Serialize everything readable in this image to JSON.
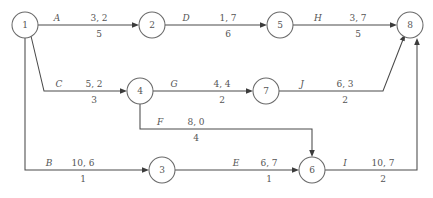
{
  "diagram": {
    "type": "directed-network",
    "node_label_format": "event number",
    "edge_label_format": "activity name, upper pair, lower value",
    "colors": {
      "background": "#ffffff",
      "line": "#4a4a4a",
      "node_stroke": "#6a6a6a",
      "text": "#555555"
    },
    "nodes": [
      {
        "id": "n1",
        "label": "1",
        "x": 25,
        "y": 25,
        "r": 13
      },
      {
        "id": "n2",
        "label": "2",
        "x": 152,
        "y": 25,
        "r": 13
      },
      {
        "id": "n5",
        "label": "5",
        "x": 280,
        "y": 25,
        "r": 13
      },
      {
        "id": "n8",
        "label": "8",
        "x": 410,
        "y": 25,
        "r": 13
      },
      {
        "id": "n4",
        "label": "4",
        "x": 140,
        "y": 91,
        "r": 13
      },
      {
        "id": "n7",
        "label": "7",
        "x": 266,
        "y": 91,
        "r": 13
      },
      {
        "id": "n3",
        "label": "3",
        "x": 162,
        "y": 170,
        "r": 13
      },
      {
        "id": "n6",
        "label": "6",
        "x": 312,
        "y": 170,
        "r": 13
      }
    ],
    "edges": [
      {
        "id": "eA",
        "name": "A",
        "from": "1",
        "to": "2",
        "upper": "3, 2",
        "lower": "5",
        "name_x": 57,
        "name_y": 21,
        "upper_x": 99,
        "upper_y": 21,
        "lower_x": 99,
        "lower_y": 37
      },
      {
        "id": "eD",
        "name": "D",
        "from": "2",
        "to": "5",
        "upper": "1, 7",
        "lower": "6",
        "name_x": 186,
        "name_y": 21,
        "upper_x": 228,
        "upper_y": 21,
        "lower_x": 228,
        "lower_y": 37
      },
      {
        "id": "eH",
        "name": "H",
        "from": "5",
        "to": "8",
        "upper": "3, 7",
        "lower": "5",
        "name_x": 318,
        "name_y": 21,
        "upper_x": 358,
        "upper_y": 21,
        "lower_x": 358,
        "lower_y": 37
      },
      {
        "id": "eC",
        "name": "C",
        "from": "1",
        "to": "4",
        "upper": "5, 2",
        "lower": "3",
        "name_x": 59,
        "name_y": 87,
        "upper_x": 94,
        "upper_y": 87,
        "lower_x": 94,
        "lower_y": 103
      },
      {
        "id": "eG",
        "name": "G",
        "from": "4",
        "to": "7",
        "upper": "4, 4",
        "lower": "2",
        "name_x": 174,
        "name_y": 87,
        "upper_x": 222,
        "upper_y": 87,
        "lower_x": 222,
        "lower_y": 103
      },
      {
        "id": "eJ",
        "name": "J",
        "from": "7",
        "to": "8",
        "upper": "6, 3",
        "lower": "2",
        "name_x": 302,
        "name_y": 87,
        "upper_x": 345,
        "upper_y": 87,
        "lower_x": 345,
        "lower_y": 103
      },
      {
        "id": "eF",
        "name": "F",
        "from": "4",
        "to": "6",
        "upper": "8, 0",
        "lower": "4",
        "name_x": 160,
        "name_y": 125,
        "upper_x": 196,
        "upper_y": 125,
        "lower_x": 196,
        "lower_y": 141
      },
      {
        "id": "eB",
        "name": "B",
        "from": "1",
        "to": "3",
        "upper": "10, 6",
        "lower": "1",
        "name_x": 49,
        "name_y": 166,
        "upper_x": 83,
        "upper_y": 166,
        "lower_x": 83,
        "lower_y": 182
      },
      {
        "id": "eE",
        "name": "E",
        "from": "3",
        "to": "6",
        "upper": "6, 7",
        "lower": "1",
        "name_x": 236,
        "name_y": 166,
        "upper_x": 269,
        "upper_y": 166,
        "lower_x": 269,
        "lower_y": 182
      },
      {
        "id": "eI",
        "name": "I",
        "from": "6",
        "to": "8",
        "upper": "10, 7",
        "lower": "2",
        "name_x": 345,
        "name_y": 166,
        "upper_x": 383,
        "upper_y": 166,
        "lower_x": 383,
        "lower_y": 182
      }
    ]
  }
}
